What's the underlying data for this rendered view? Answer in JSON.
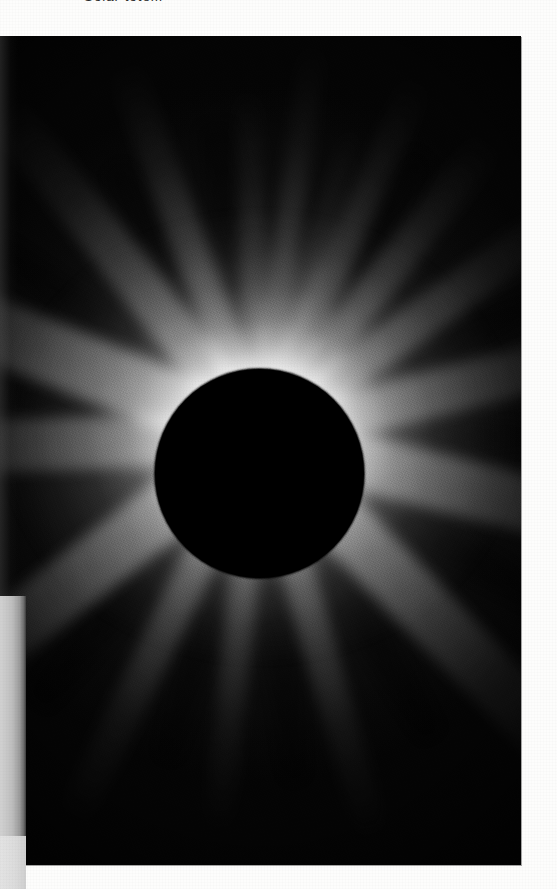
{
  "page": {
    "background_color": "#fdfdfc",
    "width": 557,
    "height": 889
  },
  "caption": {
    "text": "Solar totem",
    "color": "#2b2b2b",
    "clipped_at_top": true
  },
  "photograph": {
    "name": "total-solar-eclipse-corona",
    "x": 0,
    "y": 36,
    "width": 521,
    "height": 829,
    "background_color": "#060606",
    "subject": "total solar eclipse",
    "moon": {
      "center_x": 259,
      "center_y": 437,
      "radius": 105,
      "color": "#000000"
    },
    "corona": {
      "highlight_color": "#ffffff",
      "midtone_color": "#b4b4b4",
      "sky_color": "#141414",
      "streamers": [
        {
          "label": "north-polar-plume-left",
          "angle": -172,
          "length": 400,
          "width": 26,
          "opacity": 0.55
        },
        {
          "label": "north-plume-upper-left",
          "angle": -156,
          "length": 395,
          "width": 30,
          "opacity": 0.62
        },
        {
          "label": "north-plume-mid-left",
          "angle": -142,
          "length": 380,
          "width": 34,
          "opacity": 0.7
        },
        {
          "label": "north-plume-center-left",
          "angle": -163,
          "length": 330,
          "width": 22,
          "opacity": 0.5
        },
        {
          "label": "north-plume-apex",
          "angle": 178,
          "length": 350,
          "width": 26,
          "opacity": 0.55
        },
        {
          "label": "north-plume-right",
          "angle": 160,
          "length": 400,
          "width": 34,
          "opacity": 0.72
        },
        {
          "label": "northeast-streamer",
          "angle": 142,
          "length": 420,
          "width": 44,
          "opacity": 0.8
        },
        {
          "label": "east-equatorial-streamer",
          "angle": 112,
          "length": 470,
          "width": 62,
          "opacity": 0.92
        },
        {
          "label": "east-lower-streamer",
          "angle": 88,
          "length": 430,
          "width": 52,
          "opacity": 0.82
        },
        {
          "label": "southeast-streamer",
          "angle": 52,
          "length": 470,
          "width": 58,
          "opacity": 0.88
        },
        {
          "label": "south-streamer-right",
          "angle": 26,
          "length": 430,
          "width": 34,
          "opacity": 0.7
        },
        {
          "label": "south-plume-center",
          "angle": 6,
          "length": 400,
          "width": 28,
          "opacity": 0.62
        },
        {
          "label": "south-plume-left",
          "angle": -16,
          "length": 420,
          "width": 32,
          "opacity": 0.68
        },
        {
          "label": "southwest-streamer",
          "angle": -44,
          "length": 470,
          "width": 56,
          "opacity": 0.86
        },
        {
          "label": "west-equatorial-streamer",
          "angle": -76,
          "length": 450,
          "width": 56,
          "opacity": 0.84
        },
        {
          "label": "west-upper-streamer",
          "angle": -104,
          "length": 420,
          "width": 46,
          "opacity": 0.76
        },
        {
          "label": "northwest-streamer",
          "angle": -126,
          "length": 400,
          "width": 38,
          "opacity": 0.72
        }
      ],
      "gaps": [
        {
          "label": "polar-gap-north-left",
          "angle": -150,
          "length": 330,
          "width": 34
        },
        {
          "label": "polar-gap-north",
          "angle": 172,
          "length": 320,
          "width": 40
        },
        {
          "label": "polar-gap-north-right",
          "angle": 152,
          "length": 310,
          "width": 30
        },
        {
          "label": "gap-northeast",
          "angle": 126,
          "length": 330,
          "width": 34
        },
        {
          "label": "gap-east",
          "angle": 100,
          "length": 340,
          "width": 30
        },
        {
          "label": "gap-southeast",
          "angle": 40,
          "length": 350,
          "width": 38
        },
        {
          "label": "gap-south-right",
          "angle": 16,
          "length": 340,
          "width": 30
        },
        {
          "label": "gap-south-left",
          "angle": -6,
          "length": 350,
          "width": 32
        },
        {
          "label": "gap-southwest",
          "angle": -30,
          "length": 350,
          "width": 34
        },
        {
          "label": "gap-west",
          "angle": -60,
          "length": 340,
          "width": 36
        },
        {
          "label": "gap-west-upper",
          "angle": -90,
          "length": 340,
          "width": 32
        },
        {
          "label": "gap-northwest",
          "angle": -116,
          "length": 330,
          "width": 30
        }
      ]
    }
  },
  "scan_artifacts": {
    "gutter_shadow": {
      "name": "page-gutter-shadow",
      "x": 0,
      "y": 596,
      "width": 26,
      "height": 293,
      "color": "#bdbdbd"
    },
    "gutter_shadow_lower": {
      "name": "page-gutter-shadow-lower",
      "x": 0,
      "y": 836,
      "width": 26,
      "height": 53,
      "color": "#dcdcdc"
    }
  }
}
